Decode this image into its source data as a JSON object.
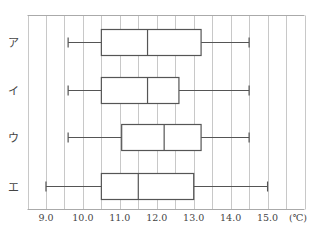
{
  "chart_data": {
    "type": "boxplot",
    "title": "",
    "xlabel": "(℃)",
    "ylabel": "",
    "xlim": [
      8.5,
      16.0
    ],
    "x_ticks": [
      9.0,
      10.0,
      11.0,
      12.0,
      13.0,
      14.0,
      15.0
    ],
    "x_tick_labels": [
      "9.0",
      "10.0",
      "11.0",
      "12.0",
      "13.0",
      "14.0",
      "15.0"
    ],
    "grid": "vertical lines every 0.5",
    "orientation": "horizontal",
    "categories": [
      "ア",
      "イ",
      "ウ",
      "エ"
    ],
    "series": [
      {
        "name": "ア",
        "min": 9.6,
        "q1": 10.5,
        "median": 11.75,
        "q3": 13.2,
        "max": 14.5
      },
      {
        "name": "イ",
        "min": 9.6,
        "q1": 10.5,
        "median": 11.75,
        "q3": 12.6,
        "max": 14.5
      },
      {
        "name": "ウ",
        "min": 9.6,
        "q1": 11.05,
        "median": 12.2,
        "q3": 13.2,
        "max": 14.5
      },
      {
        "name": "エ",
        "min": 9.0,
        "q1": 10.5,
        "median": 11.5,
        "q3": 13.0,
        "max": 15.0
      }
    ],
    "unit_label": "(℃)"
  },
  "colors": {
    "grid": "#c8c8c8",
    "box_stroke": "#555555",
    "frame": "#aaaaaa"
  }
}
